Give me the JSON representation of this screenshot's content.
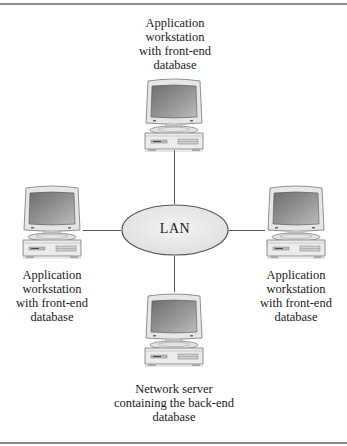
{
  "diagram": {
    "type": "star-network",
    "hub": {
      "label": "LAN",
      "fill": "#ececec",
      "stroke": "#555555"
    },
    "nodes": [
      {
        "id": "top",
        "position": "top",
        "label": "Application\nworkstation\nwith front-end\ndatabase"
      },
      {
        "id": "left",
        "position": "left",
        "label": "Application\nworkstation\nwith front-end\ndatabase"
      },
      {
        "id": "right",
        "position": "right",
        "label": "Application\nworkstation\nwith front-end\ndatabase"
      },
      {
        "id": "bottom",
        "position": "bottom",
        "label": "Network server\ncontaining the back-end\ndatabase"
      }
    ],
    "edges": [
      {
        "from": "top",
        "to": "hub"
      },
      {
        "from": "left",
        "to": "hub"
      },
      {
        "from": "right",
        "to": "hub"
      },
      {
        "from": "bottom",
        "to": "hub"
      }
    ]
  }
}
